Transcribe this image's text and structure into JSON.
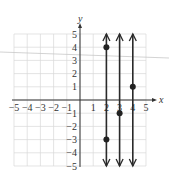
{
  "chart_data": {
    "type": "line",
    "title": "",
    "xlabel": "x",
    "ylabel": "y",
    "xlim": [
      -5,
      5
    ],
    "ylim": [
      -5,
      5
    ],
    "grid": true,
    "x_ticks": [
      -5,
      -4,
      -3,
      -2,
      -1,
      1,
      2,
      3,
      4,
      5
    ],
    "y_ticks": [
      5,
      4,
      3,
      2,
      1,
      -1,
      -2,
      -3,
      -4,
      -5
    ],
    "x_tick_labels": [
      "−5",
      "−4",
      "−3",
      "−2",
      "−1",
      "1",
      "2",
      "3",
      "4",
      "5"
    ],
    "y_tick_labels": [
      "5",
      "4",
      "3",
      "2",
      "1",
      "−1",
      "−2",
      "−3",
      "−4",
      "−5"
    ],
    "series": [
      {
        "name": "x = 2",
        "kind": "vertical-line",
        "x": 2,
        "points": [
          [
            2,
            4
          ],
          [
            2,
            -3
          ]
        ]
      },
      {
        "name": "x = 3",
        "kind": "vertical-line",
        "x": 3,
        "points": [
          [
            3,
            -1
          ]
        ]
      },
      {
        "name": "x = 4",
        "kind": "vertical-line",
        "x": 4,
        "points": [
          [
            4,
            1
          ]
        ]
      }
    ],
    "annotations": [
      "arrows on both ends of each vertical line indicating infinite extent"
    ]
  },
  "colors": {
    "grid": "#d8d8d8",
    "axis": "#333333",
    "line": "#2a2a2a",
    "point": "#222222",
    "scan_line": "#c8c8c8"
  }
}
